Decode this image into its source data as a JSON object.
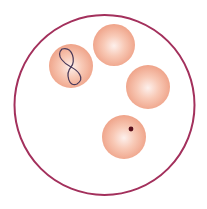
{
  "figure": {
    "description": "Microscope field with four red blood cells; one with a Cabot ring and one with a Howell-Jolly body",
    "field": {
      "cx": 104.5,
      "cy": 105,
      "r": 90,
      "stroke": "#a3305c",
      "stroke_width": 2
    },
    "colors": {
      "cell_center": "#fdf0ec",
      "cell_mid": "#f8c9b6",
      "cell_edge": "#ee9f84",
      "cabot_ring": "#4a3a5a",
      "inclusion": "#5a0f1c"
    },
    "cells": [
      {
        "id": "cell-cabot-ring",
        "cx": 71,
        "cy": 66,
        "r": 22,
        "inclusion": "cabot-ring"
      },
      {
        "id": "cell-normal-1",
        "cx": 114,
        "cy": 45,
        "r": 21,
        "inclusion": "none"
      },
      {
        "id": "cell-normal-2",
        "cx": 148,
        "cy": 87,
        "r": 22,
        "inclusion": "none"
      },
      {
        "id": "cell-howell-jolly",
        "cx": 124,
        "cy": 137,
        "r": 22,
        "inclusion": "howell-jolly-body",
        "dot": {
          "cx": 131,
          "cy": 129,
          "r": 2.4
        }
      }
    ]
  }
}
